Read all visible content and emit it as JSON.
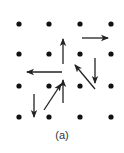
{
  "caption": "(a)",
  "colors": {
    "dot": "#111111",
    "arrow": "#222222",
    "background": "#ffffff"
  },
  "grid": {
    "cols": [
      19,
      49,
      80,
      111
    ],
    "rows": [
      24,
      54,
      86,
      117
    ],
    "dot_radius": 2.6
  },
  "arrows": [
    {
      "name": "arrow-right-top",
      "x1": 82,
      "y1": 38,
      "x2": 108,
      "y2": 38
    },
    {
      "name": "arrow-up-center-top",
      "x1": 63,
      "y1": 64,
      "x2": 63,
      "y2": 39
    },
    {
      "name": "arrow-down-right",
      "x1": 95,
      "y1": 58,
      "x2": 95,
      "y2": 83
    },
    {
      "name": "arrow-left-middle",
      "x1": 62,
      "y1": 72,
      "x2": 27,
      "y2": 72
    },
    {
      "name": "arrow-up-left-diagonal",
      "x1": 95,
      "y1": 89,
      "x2": 75,
      "y2": 65
    },
    {
      "name": "arrow-up-center-bottom",
      "x1": 63,
      "y1": 103,
      "x2": 63,
      "y2": 80
    },
    {
      "name": "arrow-up-right-diagonal",
      "x1": 44,
      "y1": 110,
      "x2": 61,
      "y2": 84
    },
    {
      "name": "arrow-down-left",
      "x1": 34,
      "y1": 94,
      "x2": 34,
      "y2": 117
    }
  ]
}
